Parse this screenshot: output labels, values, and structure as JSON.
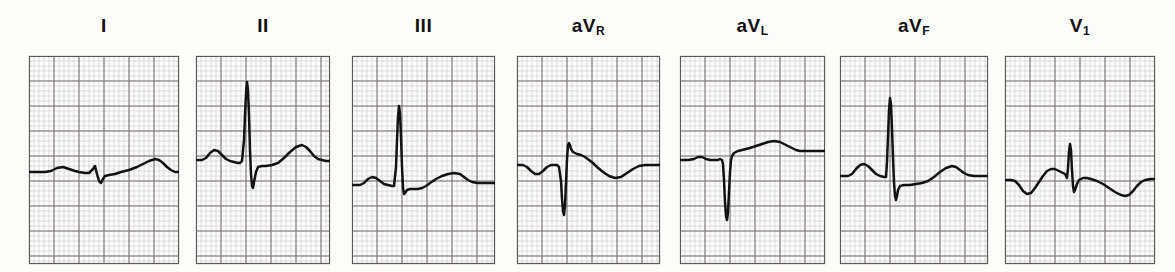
{
  "figure": {
    "paper_color": "#fdfdfc",
    "trace_color": "#121212",
    "grid_fine_color": "#b9b5b2",
    "grid_bold_color": "#6e6a68",
    "grid_small_mm_px": 5,
    "grid_large_mm_px": 25
  },
  "chart_data": {
    "type": "line",
    "xlabel": "",
    "ylabel": "",
    "grid": true,
    "legend_position": "none",
    "x_units": "mm (25 mm/s)",
    "y_units": "mm (10 mm/mV)",
    "leads": [
      {
        "name": "I",
        "label_base": "I",
        "label_sub": "",
        "panel_px": {
          "x": 29,
          "y": 56,
          "w": 150,
          "h": 208
        },
        "baseline_px": 172,
        "description": "Low voltage complex: small P, tiny r, small Q/S dip, gentle ST elevation into a broad low T wave",
        "points": [
          [
            0,
            0
          ],
          [
            10,
            0
          ],
          [
            16,
            0
          ],
          [
            22,
            -1
          ],
          [
            28,
            -4
          ],
          [
            34,
            -5
          ],
          [
            40,
            -3
          ],
          [
            46,
            -1
          ],
          [
            50,
            0
          ],
          [
            56,
            1
          ],
          [
            60,
            1
          ],
          [
            64,
            -3
          ],
          [
            66,
            -6
          ],
          [
            68,
            2
          ],
          [
            70,
            9
          ],
          [
            72,
            11
          ],
          [
            74,
            7
          ],
          [
            76,
            4
          ],
          [
            80,
            3
          ],
          [
            86,
            2
          ],
          [
            92,
            0
          ],
          [
            100,
            -2
          ],
          [
            108,
            -5
          ],
          [
            114,
            -8
          ],
          [
            120,
            -11
          ],
          [
            126,
            -13
          ],
          [
            130,
            -12
          ],
          [
            134,
            -9
          ],
          [
            138,
            -5
          ],
          [
            142,
            -2
          ],
          [
            146,
            0
          ],
          [
            150,
            0
          ],
          [
            158,
            0
          ],
          [
            168,
            0
          ],
          [
            178,
            0
          ]
        ]
      },
      {
        "name": "II",
        "label_base": "II",
        "label_sub": "",
        "panel_px": {
          "x": 196,
          "y": 56,
          "w": 134,
          "h": 208
        },
        "baseline_px": 160,
        "description": "Prominent P wave, tall narrow R wave reaching the upper grid, deep S wave, rounded T wave",
        "points": [
          [
            0,
            0
          ],
          [
            6,
            0
          ],
          [
            10,
            -2
          ],
          [
            14,
            -7
          ],
          [
            18,
            -10
          ],
          [
            22,
            -9
          ],
          [
            26,
            -5
          ],
          [
            30,
            -1
          ],
          [
            34,
            1
          ],
          [
            38,
            2
          ],
          [
            42,
            3
          ],
          [
            44,
            3
          ],
          [
            46,
            1
          ],
          [
            48,
            -20
          ],
          [
            49,
            -45
          ],
          [
            50,
            -66
          ],
          [
            51,
            -78
          ],
          [
            52,
            -70
          ],
          [
            53,
            -45
          ],
          [
            54,
            -10
          ],
          [
            55,
            14
          ],
          [
            56,
            26
          ],
          [
            57,
            28
          ],
          [
            58,
            22
          ],
          [
            60,
            12
          ],
          [
            62,
            7
          ],
          [
            66,
            6
          ],
          [
            70,
            6
          ],
          [
            76,
            5
          ],
          [
            82,
            3
          ],
          [
            88,
            -2
          ],
          [
            94,
            -8
          ],
          [
            100,
            -13
          ],
          [
            106,
            -15
          ],
          [
            110,
            -13
          ],
          [
            114,
            -9
          ],
          [
            118,
            -4
          ],
          [
            122,
            -1
          ],
          [
            126,
            0
          ],
          [
            130,
            1
          ],
          [
            134,
            1
          ]
        ]
      },
      {
        "name": "III",
        "label_base": "III",
        "label_sub": "",
        "panel_px": {
          "x": 352,
          "y": 56,
          "w": 143,
          "h": 208
        },
        "baseline_px": 185,
        "description": "Small P wave, very tall narrow R wave, small S wave, flat ST then a rounded T wave",
        "points": [
          [
            0,
            0
          ],
          [
            8,
            0
          ],
          [
            12,
            -2
          ],
          [
            16,
            -6
          ],
          [
            20,
            -8
          ],
          [
            24,
            -7
          ],
          [
            28,
            -4
          ],
          [
            32,
            -1
          ],
          [
            36,
            0
          ],
          [
            40,
            1
          ],
          [
            42,
            1
          ],
          [
            44,
            -18
          ],
          [
            45,
            -45
          ],
          [
            46,
            -68
          ],
          [
            47,
            -79
          ],
          [
            48,
            -72
          ],
          [
            49,
            -48
          ],
          [
            50,
            -18
          ],
          [
            51,
            3
          ],
          [
            52,
            9
          ],
          [
            53,
            8
          ],
          [
            55,
            5
          ],
          [
            58,
            4
          ],
          [
            62,
            4
          ],
          [
            66,
            4
          ],
          [
            70,
            3
          ],
          [
            74,
            1
          ],
          [
            78,
            -2
          ],
          [
            84,
            -6
          ],
          [
            90,
            -9
          ],
          [
            96,
            -11
          ],
          [
            102,
            -12
          ],
          [
            108,
            -11
          ],
          [
            112,
            -8
          ],
          [
            116,
            -5
          ],
          [
            120,
            -3
          ],
          [
            126,
            -2
          ],
          [
            132,
            -2
          ],
          [
            138,
            -2
          ],
          [
            143,
            -2
          ]
        ]
      },
      {
        "name": "aVR",
        "label_base": "aV",
        "label_sub": "R",
        "panel_px": {
          "x": 517,
          "y": 56,
          "w": 143,
          "h": 208
        },
        "baseline_px": 165,
        "description": "Inverted P wave, deep narrow QS complex with a small terminal r spike, inverted T wave",
        "points": [
          [
            0,
            0
          ],
          [
            6,
            0
          ],
          [
            10,
            2
          ],
          [
            14,
            6
          ],
          [
            18,
            9
          ],
          [
            22,
            9
          ],
          [
            26,
            6
          ],
          [
            30,
            2
          ],
          [
            34,
            0
          ],
          [
            38,
            0
          ],
          [
            40,
            0
          ],
          [
            42,
            2
          ],
          [
            44,
            16
          ],
          [
            45,
            34
          ],
          [
            46,
            46
          ],
          [
            47,
            50
          ],
          [
            48,
            40
          ],
          [
            49,
            18
          ],
          [
            50,
            -6
          ],
          [
            51,
            -20
          ],
          [
            52,
            -22
          ],
          [
            53,
            -20
          ],
          [
            54,
            -16
          ],
          [
            56,
            -13
          ],
          [
            60,
            -11
          ],
          [
            64,
            -10
          ],
          [
            68,
            -8
          ],
          [
            72,
            -5
          ],
          [
            76,
            -2
          ],
          [
            80,
            2
          ],
          [
            86,
            7
          ],
          [
            92,
            11
          ],
          [
            98,
            13
          ],
          [
            104,
            12
          ],
          [
            110,
            8
          ],
          [
            116,
            4
          ],
          [
            122,
            1
          ],
          [
            128,
            0
          ],
          [
            134,
            0
          ],
          [
            143,
            0
          ]
        ]
      },
      {
        "name": "aVL",
        "label_base": "aV",
        "label_sub": "L",
        "panel_px": {
          "x": 680,
          "y": 56,
          "w": 145,
          "h": 208
        },
        "baseline_px": 160,
        "description": "Small notched P, deep narrow QS downward spike, ST rising into a broad upright T wave",
        "points": [
          [
            0,
            0
          ],
          [
            8,
            0
          ],
          [
            14,
            -1
          ],
          [
            18,
            -3
          ],
          [
            22,
            -3
          ],
          [
            26,
            -1
          ],
          [
            30,
            0
          ],
          [
            34,
            0
          ],
          [
            38,
            0
          ],
          [
            40,
            -1
          ],
          [
            42,
            0
          ],
          [
            43,
            4
          ],
          [
            44,
            20
          ],
          [
            45,
            42
          ],
          [
            46,
            56
          ],
          [
            47,
            60
          ],
          [
            48,
            52
          ],
          [
            49,
            32
          ],
          [
            50,
            12
          ],
          [
            51,
            0
          ],
          [
            52,
            -4
          ],
          [
            54,
            -7
          ],
          [
            58,
            -9
          ],
          [
            62,
            -10
          ],
          [
            66,
            -11
          ],
          [
            70,
            -12
          ],
          [
            76,
            -14
          ],
          [
            82,
            -16
          ],
          [
            88,
            -18
          ],
          [
            94,
            -19
          ],
          [
            100,
            -18
          ],
          [
            106,
            -15
          ],
          [
            112,
            -12
          ],
          [
            116,
            -10
          ],
          [
            120,
            -9
          ],
          [
            126,
            -9
          ],
          [
            132,
            -9
          ],
          [
            138,
            -9
          ],
          [
            145,
            -9
          ]
        ]
      },
      {
        "name": "aVF",
        "label_base": "aV",
        "label_sub": "F",
        "panel_px": {
          "x": 840,
          "y": 56,
          "w": 148,
          "h": 208
        },
        "baseline_px": 176,
        "description": "Broad rounded P wave, tall narrow R wave, deep S wave, flat ST into a small rounded T wave",
        "points": [
          [
            0,
            0
          ],
          [
            8,
            0
          ],
          [
            12,
            -2
          ],
          [
            16,
            -7
          ],
          [
            20,
            -11
          ],
          [
            24,
            -12
          ],
          [
            28,
            -10
          ],
          [
            32,
            -6
          ],
          [
            36,
            -2
          ],
          [
            40,
            0
          ],
          [
            44,
            1
          ],
          [
            46,
            1
          ],
          [
            47,
            -14
          ],
          [
            48,
            -40
          ],
          [
            49,
            -66
          ],
          [
            50,
            -78
          ],
          [
            51,
            -72
          ],
          [
            52,
            -48
          ],
          [
            53,
            -18
          ],
          [
            54,
            6
          ],
          [
            55,
            20
          ],
          [
            56,
            24
          ],
          [
            57,
            20
          ],
          [
            58,
            14
          ],
          [
            60,
            10
          ],
          [
            64,
            9
          ],
          [
            70,
            9
          ],
          [
            76,
            8
          ],
          [
            82,
            7
          ],
          [
            88,
            5
          ],
          [
            94,
            1
          ],
          [
            100,
            -4
          ],
          [
            106,
            -8
          ],
          [
            112,
            -10
          ],
          [
            116,
            -9
          ],
          [
            120,
            -6
          ],
          [
            124,
            -3
          ],
          [
            128,
            -1
          ],
          [
            134,
            0
          ],
          [
            140,
            0
          ],
          [
            148,
            0
          ]
        ]
      },
      {
        "name": "V1",
        "label_base": "V",
        "label_sub": "1",
        "panel_px": {
          "x": 1005,
          "y": 56,
          "w": 150,
          "h": 208
        },
        "baseline_px": 180,
        "description": "Biphasic P with negative trough, rounded r hump, sharp narrow R spike, deep S, broad inverted T wave",
        "points": [
          [
            0,
            0
          ],
          [
            6,
            0
          ],
          [
            10,
            1
          ],
          [
            14,
            5
          ],
          [
            18,
            11
          ],
          [
            22,
            14
          ],
          [
            26,
            13
          ],
          [
            30,
            8
          ],
          [
            34,
            2
          ],
          [
            38,
            -4
          ],
          [
            42,
            -9
          ],
          [
            46,
            -11
          ],
          [
            50,
            -11
          ],
          [
            54,
            -9
          ],
          [
            58,
            -7
          ],
          [
            60,
            -6
          ],
          [
            62,
            -2
          ],
          [
            63,
            -12
          ],
          [
            64,
            -28
          ],
          [
            65,
            -36
          ],
          [
            66,
            -30
          ],
          [
            67,
            -10
          ],
          [
            68,
            6
          ],
          [
            69,
            12
          ],
          [
            70,
            10
          ],
          [
            72,
            4
          ],
          [
            74,
            0
          ],
          [
            78,
            -2
          ],
          [
            82,
            -2
          ],
          [
            86,
            -1
          ],
          [
            92,
            1
          ],
          [
            98,
            4
          ],
          [
            104,
            8
          ],
          [
            110,
            12
          ],
          [
            116,
            15
          ],
          [
            120,
            16
          ],
          [
            124,
            15
          ],
          [
            128,
            11
          ],
          [
            132,
            6
          ],
          [
            136,
            2
          ],
          [
            140,
            0
          ],
          [
            146,
            -1
          ],
          [
            150,
            -1
          ]
        ]
      }
    ]
  }
}
